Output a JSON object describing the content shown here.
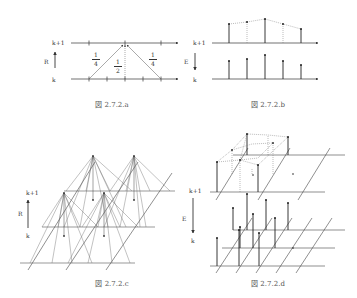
{
  "figures": [
    {
      "id": "a",
      "caption": "図 2.7.2.a",
      "operator_label": "R",
      "arrow_direction": "up",
      "level_top": "k+1",
      "level_bottom": "k",
      "weights": [
        {
          "num": "1",
          "den": "4"
        },
        {
          "num": "1",
          "den": "2"
        },
        {
          "num": "1",
          "den": "4"
        }
      ]
    },
    {
      "id": "b",
      "caption": "図 2.7.2.b",
      "operator_label": "E",
      "arrow_direction": "down",
      "level_top": "k+1",
      "level_bottom": "k"
    },
    {
      "id": "c",
      "caption": "図 2.7.2.c",
      "operator_label": "R",
      "arrow_direction": "up",
      "level_top": "k+1",
      "level_bottom": "k"
    },
    {
      "id": "d",
      "caption": "図 2.7.2.d",
      "operator_label": "E",
      "arrow_direction": "down",
      "level_top": "k+1",
      "level_bottom": "k"
    }
  ]
}
